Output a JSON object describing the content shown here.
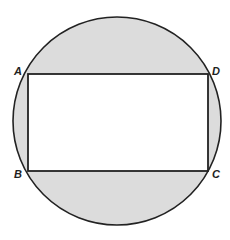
{
  "diagram": {
    "circle": {
      "cx": 117,
      "cy": 121,
      "r": 104,
      "fill": "#dcdcdc",
      "stroke": "#222222"
    },
    "rectangle": {
      "x": 28,
      "y": 74,
      "width": 180,
      "height": 97,
      "fill": "#ffffff",
      "stroke": "#222222"
    },
    "vertices": [
      {
        "name": "A",
        "x": 28,
        "y": 74,
        "label_x": 14,
        "label_y": 75
      },
      {
        "name": "D",
        "x": 208,
        "y": 74,
        "label_x": 212,
        "label_y": 75
      },
      {
        "name": "B",
        "x": 28,
        "y": 171,
        "label_x": 14,
        "label_y": 178
      },
      {
        "name": "C",
        "x": 208,
        "y": 171,
        "label_x": 212,
        "label_y": 178
      }
    ]
  }
}
